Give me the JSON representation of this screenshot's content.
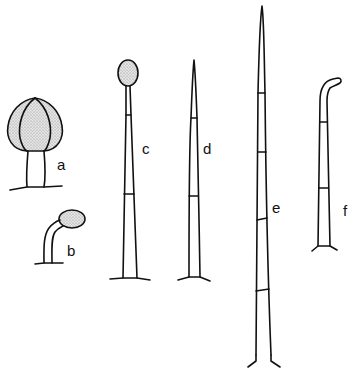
{
  "figure": {
    "colors": {
      "line": "#111111",
      "head_fill": "#d9d9d9",
      "background": "#ffffff"
    },
    "panels": [
      {
        "id": "a",
        "label": "a",
        "description": "short stalk with large lobed stippled head"
      },
      {
        "id": "b",
        "label": "b",
        "description": "short curved stalk with small stippled ovoid head"
      },
      {
        "id": "c",
        "label": "c",
        "description": "tall tapering septate stalk with stippled ovoid head"
      },
      {
        "id": "d",
        "label": "d",
        "description": "tall tapering septate hair with pointed tip"
      },
      {
        "id": "e",
        "label": "e",
        "description": "very long tapering septate hair with pointed tip and spreading base"
      },
      {
        "id": "f",
        "label": "f",
        "description": "septate hair with hooked tip"
      }
    ]
  }
}
